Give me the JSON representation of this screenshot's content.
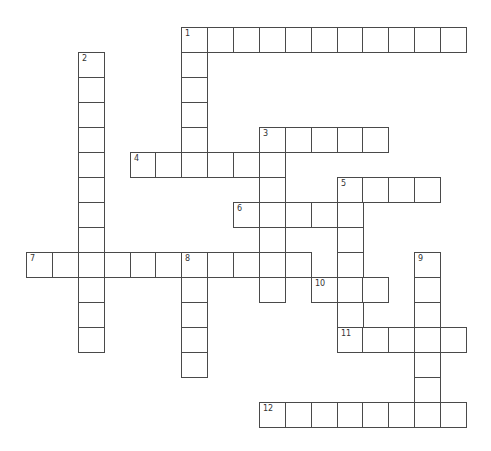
{
  "puzzle": {
    "type": "crossword",
    "words": [
      {
        "number": "1",
        "direction": "across",
        "col": 6,
        "row": 0,
        "length": 11
      },
      {
        "number": "1",
        "direction": "down",
        "col": 6,
        "row": 0,
        "length": 6
      },
      {
        "number": "2",
        "direction": "down",
        "col": 2,
        "row": 1,
        "length": 12
      },
      {
        "number": "3",
        "direction": "across",
        "col": 9,
        "row": 4,
        "length": 5
      },
      {
        "number": "3",
        "direction": "down",
        "col": 9,
        "row": 4,
        "length": 7
      },
      {
        "number": "4",
        "direction": "across",
        "col": 4,
        "row": 5,
        "length": 6
      },
      {
        "number": "5",
        "direction": "across",
        "col": 12,
        "row": 6,
        "length": 4
      },
      {
        "number": "5",
        "direction": "down",
        "col": 12,
        "row": 6,
        "length": 7
      },
      {
        "number": "6",
        "direction": "across",
        "col": 8,
        "row": 7,
        "length": 5
      },
      {
        "number": "7",
        "direction": "across",
        "col": 0,
        "row": 9,
        "length": 11
      },
      {
        "number": "8",
        "direction": "down",
        "col": 6,
        "row": 9,
        "length": 5
      },
      {
        "number": "9",
        "direction": "down",
        "col": 15,
        "row": 9,
        "length": 7
      },
      {
        "number": "10",
        "direction": "across",
        "col": 11,
        "row": 10,
        "length": 3
      },
      {
        "number": "11",
        "direction": "across",
        "col": 12,
        "row": 12,
        "length": 5
      },
      {
        "number": "12",
        "direction": "across",
        "col": 9,
        "row": 15,
        "length": 8
      }
    ]
  }
}
